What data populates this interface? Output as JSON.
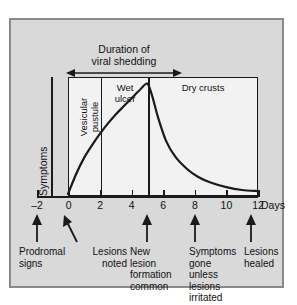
{
  "chart_data": {
    "type": "line",
    "title": "Duration of\nviral shedding",
    "xlabel": "Days",
    "ylabel": "Symptoms",
    "xlim": [
      -2,
      12
    ],
    "ylim": [
      0,
      1
    ],
    "grid": false,
    "legend": "none",
    "xticks": [
      -2,
      0,
      2,
      4,
      6,
      8,
      10,
      12
    ],
    "xtick_labels": [
      "–2",
      "0",
      "2",
      "4",
      "6",
      "8",
      "10",
      "12"
    ],
    "days_unit_label": "Days",
    "series": [
      {
        "name": "Symptoms",
        "x": [
          0,
          0.5,
          1,
          1.5,
          2,
          2.5,
          3,
          3.5,
          4,
          4.5,
          5,
          5.3,
          5.7,
          6.2,
          6.8,
          7.5,
          8.2,
          9,
          10,
          11,
          12
        ],
        "values": [
          0.0,
          0.17,
          0.31,
          0.42,
          0.52,
          0.61,
          0.69,
          0.76,
          0.83,
          0.9,
          0.96,
          0.86,
          0.66,
          0.46,
          0.32,
          0.22,
          0.15,
          0.1,
          0.06,
          0.035,
          0.025
        ]
      }
    ],
    "phases": [
      {
        "label": "Vesicular\npustule",
        "start": 0,
        "end": 2,
        "orientation": "vertical"
      },
      {
        "label": "Wet\nulcer",
        "start": 2,
        "end": 5,
        "orientation": "horizontal"
      },
      {
        "label": "Dry crusts",
        "start": 5,
        "end": 12,
        "orientation": "horizontal"
      }
    ],
    "duration_bracket": {
      "label": "Duration of\nviral shedding",
      "start": 0,
      "end": 5
    },
    "annotations": [
      {
        "text": "Prodromal\nsigns",
        "day": -2,
        "arrow": "straight"
      },
      {
        "text": "Lesions\nnoted",
        "day": 0,
        "arrow": "slanted"
      },
      {
        "text": "New\nlesion\nformation\ncommon",
        "day": 5,
        "arrow": "straight"
      },
      {
        "text": "Symptoms\ngone\nunless\nlesions\nirritated",
        "day": 8,
        "arrow": "straight"
      },
      {
        "text": "Lesions\nhealed",
        "day": 12,
        "arrow": "straight"
      }
    ],
    "colors": {
      "panel_background": "#d9d9d9",
      "plot_background": "#f2f2f2",
      "ink": "#1a1a1a",
      "panel_border": "#8a8a8a"
    }
  }
}
